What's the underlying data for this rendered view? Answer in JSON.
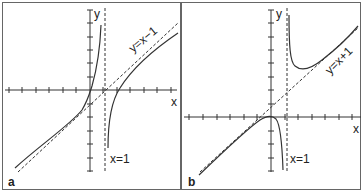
{
  "figure": {
    "panels": [
      {
        "id": "a",
        "label": "a",
        "axis_x_label": "x",
        "axis_y_label": "y",
        "oblique_asymptote_label": "y=x−1",
        "vertical_asymptote_label": "x=1",
        "function_description": "curve with vertical asymptote x=1 and oblique asymptote y=x-1; left branch through origin rising to +inf, right branch from -inf rising along asymptote"
      },
      {
        "id": "b",
        "label": "b",
        "axis_x_label": "x",
        "axis_y_label": "y",
        "oblique_asymptote_label": "y=x+1",
        "vertical_asymptote_label": "x=1",
        "function_description": "curve with vertical asymptote x=1 and oblique asymptote y=x+1; left branch with local max at origin falling to -inf, right branch from +inf with local min then rising along asymptote"
      }
    ],
    "colors": {
      "line": "#333333",
      "border": "#555555",
      "background": "#ffffff"
    }
  }
}
